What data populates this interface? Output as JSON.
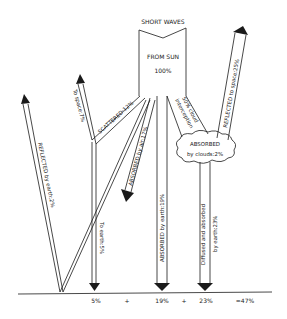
{
  "diagram": {
    "title": "SHORT WAVES",
    "source": {
      "label": "FROM SUN",
      "value": "100%"
    },
    "flows": {
      "scattered": "SCATTERED:12%",
      "to_space": "To space:7%",
      "to_earth": "To earth:5%",
      "reflected_by_earth": "REFLECTED by earth:2%",
      "absorbed_by_air": "ABSORBED by air:17%",
      "absorbed_by_earth": "ABSORBED by earth:19%",
      "cloud_interception_line1": "50% cloud",
      "cloud_interception_line2": "interception",
      "reflected_to_space": "REFLECTED to space:25%",
      "absorbed_by_clouds_line1": "ABSORBED",
      "absorbed_by_clouds_line2": "by clouds:2%",
      "diffused_line1": "Diffused and absorbed",
      "diffused_line2": "by earth:23%"
    },
    "equation": {
      "term1": "5%",
      "plus1": "+",
      "term2": "19%",
      "plus2": "+",
      "term3": "23%",
      "result": "=47%"
    }
  }
}
